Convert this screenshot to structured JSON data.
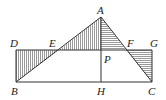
{
  "diagram": {
    "type": "geometry-figure",
    "points": {
      "A": {
        "label": "A",
        "x": 101,
        "y": 17
      },
      "B": {
        "label": "B",
        "x": 16,
        "y": 82
      },
      "C": {
        "label": "C",
        "x": 152,
        "y": 82
      },
      "D": {
        "label": "D",
        "x": 16,
        "y": 50
      },
      "E": {
        "label": "E",
        "x": 59,
        "y": 50
      },
      "F": {
        "label": "F",
        "x": 126,
        "y": 50
      },
      "G": {
        "label": "G",
        "x": 152,
        "y": 50
      },
      "H": {
        "label": "H",
        "x": 101,
        "y": 82
      },
      "P": {
        "label": "P",
        "x": 101,
        "y": 50
      }
    },
    "segments": [
      "AB",
      "AC",
      "BC",
      "AH",
      "DG",
      "DB",
      "GC"
    ],
    "shaded_regions": [
      {
        "vertices": [
          "D",
          "B",
          "E"
        ],
        "hatch": "vertical"
      },
      {
        "vertices": [
          "A",
          "E",
          "P"
        ],
        "hatch": "vertical"
      },
      {
        "vertices": [
          "A",
          "P",
          "F"
        ],
        "hatch": "horizontal"
      },
      {
        "vertices": [
          "F",
          "G",
          "C"
        ],
        "hatch": "horizontal"
      }
    ],
    "colors": {
      "line": "#333333",
      "hatch": "#555555",
      "background": "#ffffff"
    }
  }
}
